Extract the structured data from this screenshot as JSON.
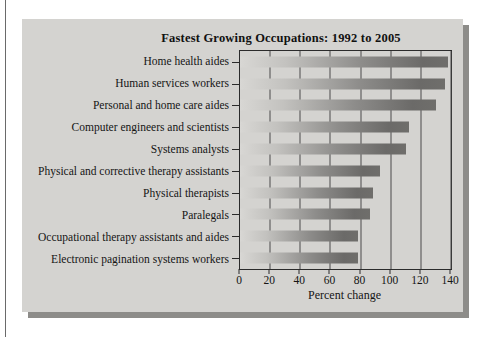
{
  "page": {
    "background": "#ffffff",
    "panel_background": "#d4d3d0",
    "panel_shadow_color": "#8d8c89",
    "axis_color": "#2b2b2b",
    "gridline_color": "#4a4a4a",
    "bar_gradient_start": "#d8d7d4",
    "bar_gradient_end": "#6b6a68"
  },
  "chart_data": {
    "type": "bar",
    "orientation": "horizontal",
    "title": "Fastest Growing Occupations: 1992 to 2005",
    "xlabel": "Percent change",
    "ylabel": "",
    "categories": [
      "Home health aides",
      "Human services workers",
      "Personal and home care aides",
      "Computer engineers and scientists",
      "Systems analysts",
      "Physical and corrective therapy assistants",
      "Physical therapists",
      "Paralegals",
      "Occupational therapy assistants and aides",
      "Electronic pagination systems workers"
    ],
    "values": [
      138,
      136,
      130,
      112,
      110,
      93,
      88,
      86,
      78,
      78
    ],
    "xlim": [
      0,
      140
    ],
    "xticks": [
      0,
      20,
      40,
      60,
      80,
      100,
      120,
      140
    ],
    "grid": "vertical gridlines at each x tick, drawn behind bars",
    "legend": "none"
  }
}
